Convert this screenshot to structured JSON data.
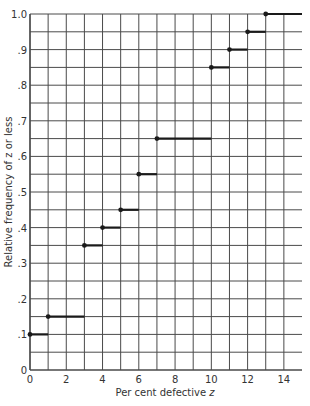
{
  "chart_data": {
    "type": "line",
    "subtype": "step",
    "title": "",
    "xlabel": "Per cent defective z",
    "ylabel": "Relative frequency of z or less",
    "xlim": [
      0,
      15
    ],
    "ylim": [
      0,
      1.0
    ],
    "x_ticks": [
      0,
      2,
      4,
      6,
      8,
      10,
      12,
      14
    ],
    "x_tick_labels": [
      "0",
      "2",
      "4",
      "6",
      "8",
      "10",
      "12",
      "14"
    ],
    "y_ticks": [
      0,
      0.1,
      0.2,
      0.3,
      0.4,
      0.5,
      0.6,
      0.7,
      0.8,
      0.9,
      1.0
    ],
    "y_tick_labels": [
      "0",
      ".1",
      ".2",
      ".3",
      ".4",
      ".5",
      ".6",
      ".7",
      ".8",
      ".9",
      "1.0"
    ],
    "grid": true,
    "grid_x_step": 1,
    "grid_y_step": 0.05,
    "legend": null,
    "series": [
      {
        "name": "Cumulative relative frequency",
        "steps": [
          {
            "x_start": 0,
            "x_end": 1,
            "y": 0.1
          },
          {
            "x_start": 1,
            "x_end": 3,
            "y": 0.15
          },
          {
            "x_start": 3,
            "x_end": 4,
            "y": 0.35
          },
          {
            "x_start": 4,
            "x_end": 5,
            "y": 0.4
          },
          {
            "x_start": 5,
            "x_end": 6,
            "y": 0.45
          },
          {
            "x_start": 6,
            "x_end": 7,
            "y": 0.55
          },
          {
            "x_start": 7,
            "x_end": 10,
            "y": 0.65
          },
          {
            "x_start": 10,
            "x_end": 11,
            "y": 0.85
          },
          {
            "x_start": 11,
            "x_end": 12,
            "y": 0.9
          },
          {
            "x_start": 12,
            "x_end": 13,
            "y": 0.95
          },
          {
            "x_start": 13,
            "x_end": 15,
            "y": 1.0
          }
        ],
        "x": [
          0,
          1,
          3,
          4,
          5,
          6,
          7,
          10,
          11,
          12,
          13
        ],
        "values": [
          0.1,
          0.15,
          0.35,
          0.4,
          0.45,
          0.55,
          0.65,
          0.85,
          0.9,
          0.95,
          1.0
        ]
      }
    ]
  },
  "labels": {
    "xlabel_text": "Per cent defective ",
    "xlabel_var": "z",
    "ylabel": "Relative frequency of z or less"
  },
  "colors": {
    "grid": "#4a4a4a",
    "step": "#1a1a1a",
    "text": "#333333"
  }
}
